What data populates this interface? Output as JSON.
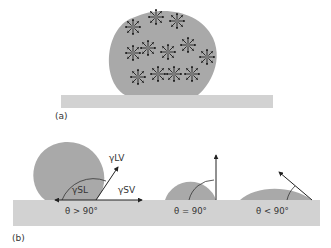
{
  "figure": {
    "colors": {
      "background": "#ffffff",
      "substrate": "#d2d2d2",
      "droplet": "#a9a9a9",
      "droplet_outline": "#8e8e8e",
      "molecule_center": "#7a7a7a",
      "arrow": "#222222",
      "text": "#333333"
    },
    "panel_a": {
      "label": "(a)",
      "description": "Droplet on substrate with molecules exerting cohesive forces in all directions",
      "molecule_count": 12
    },
    "panel_b": {
      "label": "(b)",
      "gamma_lv": "γLV",
      "gamma_sl": "γSL",
      "gamma_sv": "γSV",
      "cases": [
        {
          "label": "θ > 90°",
          "name": "non-wetting"
        },
        {
          "label": "θ = 90°",
          "name": "neutral"
        },
        {
          "label": "θ < 90°",
          "name": "wetting"
        }
      ]
    }
  }
}
